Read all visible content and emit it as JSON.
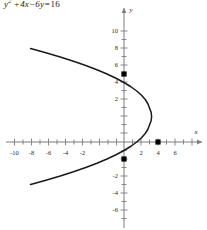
{
  "title": {
    "full_text": "y^2 + 4x - 6y = 16",
    "lhs_var": "y",
    "exponent": "2",
    "term_plus": "+",
    "term_4x": "4x",
    "term_minus": "−",
    "term_6y": "6y",
    "equals": "=",
    "rhs": "16"
  },
  "axes": {
    "x_label": "x",
    "y_label": "y",
    "x_tick_labels": [
      "-10",
      "-8",
      "-6",
      "-4",
      "-2",
      "2",
      "4",
      "6"
    ],
    "y_tick_labels": [
      "10",
      "8",
      "6",
      "4",
      "2",
      "-2",
      "-4",
      "-6"
    ],
    "axis_color": "#7d7d7d",
    "curve_color": "#1a1a1a",
    "point_color": "#000000"
  },
  "chart_data": {
    "type": "line",
    "xlabel": "x",
    "ylabel": "y",
    "xlim": [
      -11.5,
      7.5
    ],
    "ylim": [
      -7.5,
      11.5
    ],
    "grid": false,
    "legend": "none",
    "equation": "y^2 + 4x - 6y = 16",
    "curve_form": "x = (25 - (y-3)^2)/4",
    "vertex": [
      6.25,
      3
    ],
    "opens": "left",
    "x_ticks": [
      -10,
      -8,
      -6,
      -4,
      -2,
      2,
      4,
      6
    ],
    "y_ticks": [
      10,
      8,
      6,
      4,
      2,
      -2,
      -4,
      -6
    ],
    "series": [
      {
        "name": "parabola",
        "points": [
          [
            -11.0,
            11.0
          ],
          [
            -9.19,
            10.5
          ],
          [
            -7.5,
            10.0
          ],
          [
            -5.94,
            9.5
          ],
          [
            -4.5,
            9.0
          ],
          [
            -3.19,
            8.5
          ],
          [
            -2.0,
            8.0
          ],
          [
            -0.94,
            7.5
          ],
          [
            0.0,
            7.0
          ],
          [
            0.81,
            6.5
          ],
          [
            1.5,
            6.0
          ],
          [
            2.06,
            5.5
          ],
          [
            2.5,
            5.0
          ],
          [
            2.81,
            4.5
          ],
          [
            3.0,
            4.0
          ],
          [
            3.19,
            3.5
          ],
          [
            3.25,
            3.0
          ],
          [
            3.19,
            2.5
          ],
          [
            3.0,
            2.0
          ],
          [
            2.81,
            1.5
          ],
          [
            2.5,
            1.0
          ],
          [
            2.06,
            0.5
          ],
          [
            1.5,
            0.0
          ],
          [
            0.81,
            -0.5
          ],
          [
            0.0,
            -1.0
          ],
          [
            -0.94,
            -1.5
          ],
          [
            -2.0,
            -2.0
          ],
          [
            -3.19,
            -2.5
          ],
          [
            -4.5,
            -3.0
          ],
          [
            -5.94,
            -3.5
          ],
          [
            -7.5,
            -4.0
          ],
          [
            -9.19,
            -4.5
          ],
          [
            -11.0,
            -5.0
          ]
        ]
      }
    ],
    "marked_points": [
      {
        "label": "(0, 8)",
        "x": 0,
        "y": 8
      },
      {
        "label": "(4, 0)",
        "x": 4,
        "y": 0
      },
      {
        "label": "(0, -2)",
        "x": 0,
        "y": -2
      }
    ]
  }
}
